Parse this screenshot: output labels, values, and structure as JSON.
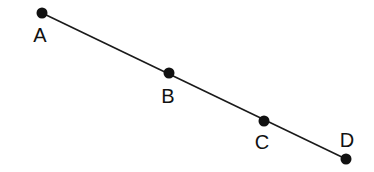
{
  "diagram": {
    "type": "collinear-points",
    "line": {
      "from": [
        42,
        13
      ],
      "to": [
        346,
        159
      ],
      "color": "#1a1a1a",
      "width": 1.6
    },
    "point_color": "#111111",
    "points": [
      {
        "label": "A",
        "x": 42,
        "y": 13,
        "label_x": 40,
        "label_y": 42
      },
      {
        "label": "B",
        "x": 169,
        "y": 73,
        "label_x": 168,
        "label_y": 103
      },
      {
        "label": "C",
        "x": 264,
        "y": 121,
        "label_x": 262,
        "label_y": 149
      },
      {
        "label": "D",
        "x": 346,
        "y": 159,
        "label_x": 347,
        "label_y": 147
      }
    ]
  }
}
